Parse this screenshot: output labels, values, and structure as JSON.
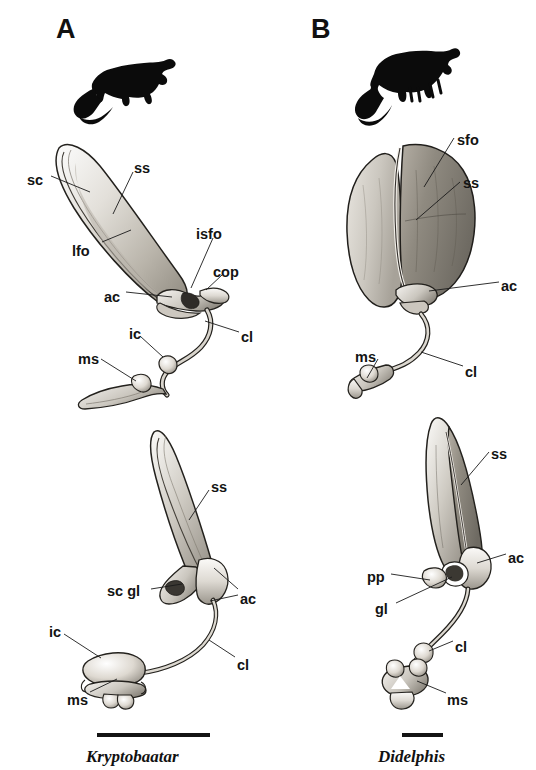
{
  "figure": {
    "background_color": "#ffffff",
    "ink_color": "#141414",
    "width": 536,
    "height": 770
  },
  "panels": [
    {
      "letter": "A",
      "taxon_caption": "Kryptobaatar",
      "silhouette_name": "multituberculate-silhouette",
      "scalebar": {
        "length_px": 113
      },
      "specimens": [
        {
          "view": "upper",
          "labels": [
            {
              "text": "sc",
              "x": 27,
              "y": 173
            },
            {
              "text": "ss",
              "x": 134,
              "y": 161
            },
            {
              "text": "lfo",
              "x": 72,
              "y": 244
            },
            {
              "text": "isfo",
              "x": 196,
              "y": 227
            },
            {
              "text": "cop",
              "x": 213,
              "y": 265
            },
            {
              "text": "ac",
              "x": 104,
              "y": 290
            },
            {
              "text": "ic",
              "x": 129,
              "y": 327
            },
            {
              "text": "cl",
              "x": 241,
              "y": 330
            },
            {
              "text": "ms",
              "x": 78,
              "y": 352
            }
          ]
        },
        {
          "view": "lower",
          "labels": [
            {
              "text": "ss",
              "x": 211,
              "y": 480
            },
            {
              "text": "sc gl",
              "x": 107,
              "y": 584
            },
            {
              "text": "ac",
              "x": 240,
              "y": 592
            },
            {
              "text": "ic",
              "x": 49,
              "y": 625
            },
            {
              "text": "cl",
              "x": 237,
              "y": 658
            },
            {
              "text": "ms",
              "x": 67,
              "y": 693
            }
          ]
        }
      ]
    },
    {
      "letter": "B",
      "taxon_caption": "Didelphis",
      "silhouette_name": "opossum-silhouette",
      "scalebar": {
        "length_px": 41
      },
      "specimens": [
        {
          "view": "upper",
          "labels": [
            {
              "text": "sfo",
              "x": 457,
              "y": 133
            },
            {
              "text": "ss",
              "x": 463,
              "y": 176
            },
            {
              "text": "ac",
              "x": 501,
              "y": 279
            },
            {
              "text": "ms",
              "x": 355,
              "y": 350
            },
            {
              "text": "cl",
              "x": 465,
              "y": 365
            }
          ]
        },
        {
          "view": "lower",
          "labels": [
            {
              "text": "ss",
              "x": 491,
              "y": 447
            },
            {
              "text": "ac",
              "x": 508,
              "y": 551
            },
            {
              "text": "pp",
              "x": 367,
              "y": 570
            },
            {
              "text": "gl",
              "x": 375,
              "y": 602
            },
            {
              "text": "cl",
              "x": 455,
              "y": 640
            },
            {
              "text": "ms",
              "x": 447,
              "y": 693
            }
          ]
        }
      ]
    }
  ],
  "abbreviation_glossary": {
    "sc": "scapula",
    "ss": "scapular spine",
    "lfo": "lateral fossa",
    "isfo": "infraspinous fossa",
    "sfo": "supraspinous fossa",
    "cop": "coracoid process",
    "ac": "acromion",
    "ic": "interclavicle",
    "cl": "clavicle",
    "ms": "manubrium sterni",
    "gl": "glenoid",
    "pp": "procoracoid process",
    "sc gl": "scapular glenoid"
  }
}
